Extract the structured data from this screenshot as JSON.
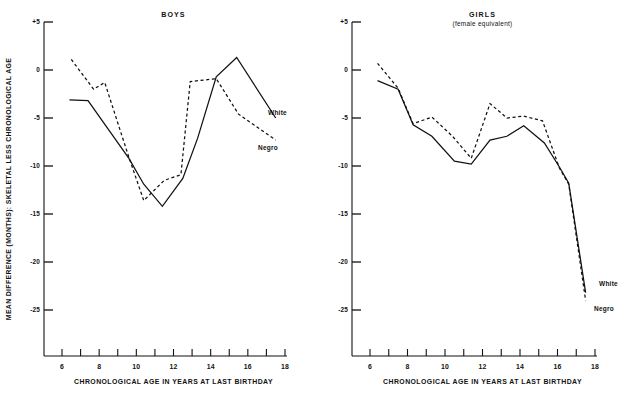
{
  "figure": {
    "background": "#ffffff",
    "ink": "#111111",
    "shared_xlabel": "CHRONOLOGICAL AGE IN YEARS AT LAST BIRTHDAY",
    "shared_ylabel": "MEAN DIFFERENCE (MONTHS): SKELETAL LESS CHRONOLOGICAL AGE"
  },
  "chart_data": [
    {
      "type": "line",
      "panel": "left",
      "title": "BOYS",
      "subtitle": "",
      "xlabel": "CHRONOLOGICAL AGE IN YEARS AT LAST BIRTHDAY",
      "ylabel": "MEAN DIFFERENCE (MONTHS): SKELETAL LESS CHRONOLOGICAL AGE",
      "xlim": [
        5.4,
        18.4
      ],
      "ylim": [
        -29.5,
        5
      ],
      "xticks": [
        6,
        7,
        8,
        9,
        10,
        11,
        12,
        13,
        14,
        15,
        16,
        17,
        18
      ],
      "xticklabels": [
        "6",
        "",
        "8",
        "",
        "10",
        "",
        "12",
        "",
        "14",
        "",
        "16",
        "",
        "18"
      ],
      "yticks": [
        5,
        0,
        -5,
        -10,
        -15,
        -20,
        -25
      ],
      "yticklabels": [
        "+5",
        "0",
        "-5",
        "-10",
        "-15",
        "-20",
        "-25"
      ],
      "grid": false,
      "legend_position": "inline-right-of-curve-ends",
      "series": [
        {
          "name": "White",
          "style": "solid",
          "x": [
            6.4,
            7.4,
            9.6,
            10.4,
            11.4,
            12.5,
            13.3,
            14.3,
            15.4,
            17.5
          ],
          "values": [
            -3.1,
            -3.2,
            -9.2,
            -11.9,
            -14.2,
            -11.3,
            -7.1,
            -0.7,
            1.3,
            -5.0
          ]
        },
        {
          "name": "Negro",
          "style": "dashed",
          "x": [
            6.5,
            7.7,
            8.3,
            9.6,
            10.4,
            11.5,
            12.4,
            12.9,
            14.3,
            15.5,
            17.5
          ],
          "values": [
            1.1,
            -2.0,
            -1.3,
            -9.1,
            -13.6,
            -11.5,
            -10.9,
            -1.2,
            -0.9,
            -4.6,
            -7.3
          ]
        }
      ]
    },
    {
      "type": "line",
      "panel": "right",
      "title": "GIRLS",
      "subtitle": "(female equivalent)",
      "xlabel": "CHRONOLOGICAL AGE IN YEARS AT LAST BIRTHDAY",
      "ylabel": "MEAN DIFFERENCE (MONTHS): SKELETAL LESS CHRONOLOGICAL AGE",
      "xlim": [
        5.4,
        18.4
      ],
      "ylim": [
        -29.5,
        5
      ],
      "xticks": [
        6,
        7,
        8,
        9,
        10,
        11,
        12,
        13,
        14,
        15,
        16,
        17,
        18
      ],
      "xticklabels": [
        "6",
        "",
        "8",
        "",
        "10",
        "",
        "12",
        "",
        "14",
        "",
        "16",
        "",
        "18"
      ],
      "yticks": [
        5,
        0,
        -5,
        -10,
        -15,
        -20,
        -25
      ],
      "yticklabels": [
        "+5",
        "0",
        "-5",
        "-10",
        "-15",
        "-20",
        "-25"
      ],
      "grid": false,
      "legend_position": "inline-right-of-curve-ends",
      "series": [
        {
          "name": "White",
          "style": "solid",
          "x": [
            6.4,
            7.5,
            8.3,
            9.3,
            10.5,
            11.4,
            12.4,
            13.3,
            14.2,
            15.3,
            16.1,
            16.6,
            17.5
          ],
          "values": [
            -1.1,
            -2.0,
            -5.7,
            -6.9,
            -9.5,
            -9.8,
            -7.3,
            -6.9,
            -5.8,
            -7.6,
            -10.1,
            -11.8,
            -23.2
          ]
        },
        {
          "name": "Negro",
          "style": "dashed",
          "x": [
            6.4,
            7.5,
            8.3,
            9.3,
            10.4,
            11.4,
            12.4,
            13.3,
            14.2,
            15.2,
            16.1,
            16.6,
            17.5
          ],
          "values": [
            0.7,
            -1.9,
            -5.6,
            -4.9,
            -6.9,
            -9.2,
            -3.5,
            -5.0,
            -4.8,
            -5.3,
            -10.2,
            -11.9,
            -24.0
          ]
        }
      ]
    }
  ]
}
